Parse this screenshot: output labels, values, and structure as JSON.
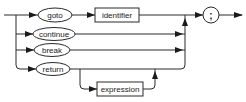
{
  "diagram": {
    "type": "railroad-syntax-diagram",
    "terminals": {
      "goto": "goto",
      "continue": "continue",
      "break": "break",
      "return": "return",
      "semicolon": ";"
    },
    "nonterminals": {
      "identifier": "identifier",
      "expression": "expression"
    },
    "colors": {
      "line": "#2a2a2a",
      "background": "#ffffff"
    }
  }
}
